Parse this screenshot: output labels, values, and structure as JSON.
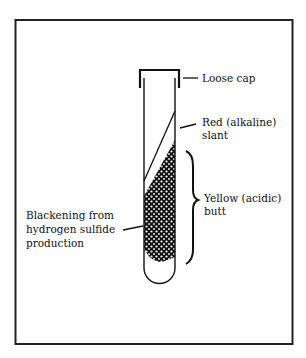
{
  "diagram": {
    "colors": {
      "ink": "#111111",
      "background": "#ffffff",
      "frame": "#222222"
    },
    "labels": {
      "cap": "Loose cap",
      "slant_line1": "Red (alkaline)",
      "slant_line2": "slant",
      "butt_line1": "Yellow (acidic)",
      "butt_line2": "butt",
      "blackening_line1": "Blackening from",
      "blackening_line2": "hydrogen sulfide",
      "blackening_line3": "production"
    }
  }
}
